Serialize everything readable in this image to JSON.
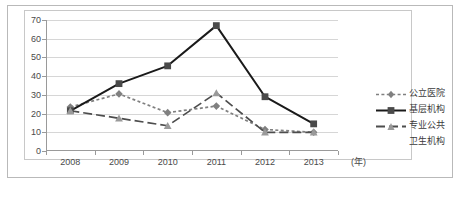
{
  "chart_data": {
    "type": "line",
    "title": "",
    "subtitle": "",
    "xlabel": "(年)",
    "ylabel": "",
    "categories": [
      "2008",
      "2009",
      "2010",
      "2011",
      "2012",
      "2013"
    ],
    "ylim": [
      0,
      70
    ],
    "yticks": [
      0,
      10,
      20,
      30,
      40,
      50,
      60,
      70
    ],
    "grid": true,
    "legend_position": "right",
    "series": [
      {
        "name": "公立医院",
        "marker": "diamond",
        "line_style": "dotted",
        "color": "#808080",
        "values": [
          23.5,
          30.5,
          20.5,
          24.0,
          11.5,
          10.0
        ]
      },
      {
        "name": "基层机构",
        "marker": "square",
        "line_style": "solid",
        "color": "#1a1a1a",
        "values": [
          21.5,
          36.0,
          45.5,
          67.0,
          29.0,
          14.5
        ]
      },
      {
        "name": "专业公共卫生机构",
        "marker": "triangle",
        "line_style": "dashed",
        "color": "#4d4d4d",
        "values": [
          21.5,
          17.5,
          13.5,
          31.0,
          10.0,
          10.0
        ]
      }
    ]
  },
  "legend": {
    "entries": [
      {
        "label": "公立医院",
        "label_line1": "公立医院",
        "label_line2": ""
      },
      {
        "label": "基层机构",
        "label_line1": "基层机构",
        "label_line2": ""
      },
      {
        "label": "专业公共卫生机构",
        "label_line1": "专业公共",
        "label_line2": "卫生机构"
      }
    ]
  },
  "axes": {
    "y_tick_labels": [
      "70",
      "60",
      "50",
      "40",
      "30",
      "20",
      "10",
      "0"
    ],
    "x_tick_labels": [
      "2008",
      "2009",
      "2010",
      "2011",
      "2012",
      "2013"
    ],
    "x_unit_label": "(年)"
  }
}
